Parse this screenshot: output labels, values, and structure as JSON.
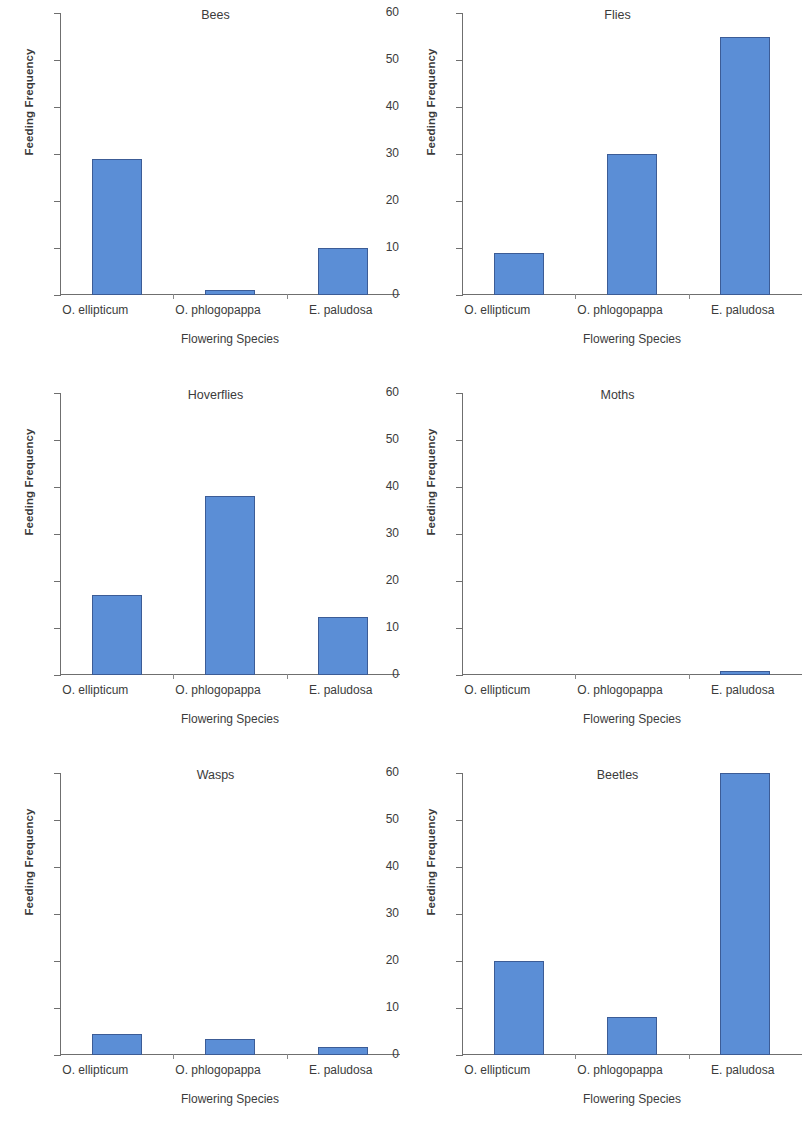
{
  "chart_data": {
    "type": "bar",
    "xlabel": "Flowering Species",
    "ylabel": "Feeding Frequency",
    "categories": [
      "O. ellipticum",
      "O. phlogopappa",
      "E. paludosa"
    ],
    "ylim": [
      0,
      60
    ],
    "yticks": [
      0,
      10,
      20,
      30,
      40,
      50,
      60
    ],
    "ytick_labels": [
      "0",
      "10",
      "20",
      "30",
      "40",
      "50",
      "60"
    ],
    "grid": false,
    "legend": "none",
    "bar_color": "#5b8ed6",
    "bar_edge_color": "#3c5c96",
    "panels": [
      {
        "title": "Bees",
        "values": [
          29,
          1,
          10
        ]
      },
      {
        "title": "Flies",
        "values": [
          9,
          30,
          55
        ]
      },
      {
        "title": "Hoverflies",
        "values": [
          17,
          38,
          12.3
        ]
      },
      {
        "title": "Moths",
        "values": [
          0,
          0,
          0.8
        ]
      },
      {
        "title": "Wasps",
        "values": [
          4.5,
          3.5,
          1.7
        ]
      },
      {
        "title": "Beetles",
        "values": [
          20,
          8,
          60
        ]
      }
    ],
    "series": [
      {
        "name": "Bees",
        "categories": [
          "O. ellipticum",
          "O. phlogopappa",
          "E. paludosa"
        ],
        "values": [
          29,
          1,
          10
        ]
      },
      {
        "name": "Flies",
        "categories": [
          "O. ellipticum",
          "O. phlogopappa",
          "E. paludosa"
        ],
        "values": [
          9,
          30,
          55
        ]
      },
      {
        "name": "Hoverflies",
        "categories": [
          "O. ellipticum",
          "O. phlogopappa",
          "E. paludosa"
        ],
        "values": [
          17,
          38,
          12.3
        ]
      },
      {
        "name": "Moths",
        "categories": [
          "O. ellipticum",
          "O. phlogopappa",
          "E. paludosa"
        ],
        "values": [
          0,
          0,
          0.8
        ]
      },
      {
        "name": "Wasps",
        "categories": [
          "O. ellipticum",
          "O. phlogopappa",
          "E. paludosa"
        ],
        "values": [
          4.5,
          3.5,
          1.7
        ]
      },
      {
        "name": "Beetles",
        "categories": [
          "O. ellipticum",
          "O. phlogopappa",
          "E. paludosa"
        ],
        "values": [
          20,
          8,
          60
        ]
      }
    ]
  }
}
